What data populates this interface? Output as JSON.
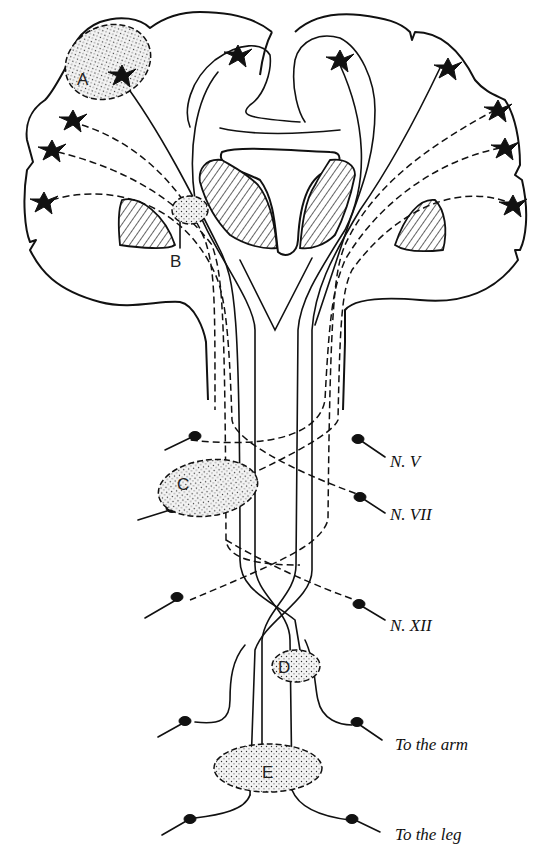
{
  "figure": {
    "lesion_labels": [
      "A",
      "B",
      "C",
      "D",
      "E"
    ],
    "cranial_nerve_labels": [
      {
        "id": "n5",
        "text": "N. V"
      },
      {
        "id": "n7",
        "text": "N. VII"
      },
      {
        "id": "n12",
        "text": "N. XII"
      }
    ],
    "limb_labels": [
      {
        "id": "arm",
        "text": "To the arm"
      },
      {
        "id": "leg",
        "text": "To the leg"
      }
    ],
    "colors": {
      "ink": "#111111",
      "background": "#ffffff"
    }
  }
}
